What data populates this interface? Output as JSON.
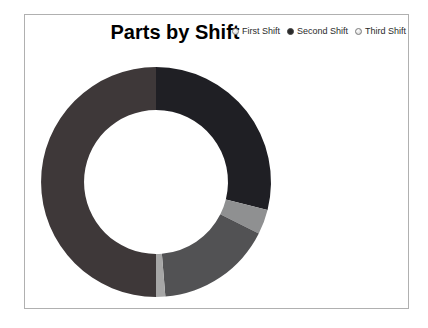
{
  "header": {
    "title": "Parts by Shift"
  },
  "legend": {
    "items": [
      {
        "label": "First Shift",
        "selected": false
      },
      {
        "label": "Second Shift",
        "selected": true
      },
      {
        "label": "Third Shift",
        "selected": false
      }
    ]
  },
  "chart_data": {
    "type": "pie",
    "title": "Parts by Shift",
    "donut": true,
    "start_angle_deg": 0,
    "clockwise": true,
    "inner_radius_ratio": 0.626,
    "legend_position": "top-right",
    "legend_entries": [
      "First Shift",
      "Second Shift",
      "Third Shift"
    ],
    "segments": [
      {
        "name": "segment-1-dark-navy",
        "value": 28.9,
        "color": "#1f1f24"
      },
      {
        "name": "segment-2-light-gray",
        "value": 3.5,
        "color": "#8f9091"
      },
      {
        "name": "segment-3-medium-gray",
        "value": 16.3,
        "color": "#525254"
      },
      {
        "name": "segment-4-pale-sliver",
        "value": 1.3,
        "color": "#a6a6a6"
      },
      {
        "name": "segment-5-dark-maroon",
        "value": 50.0,
        "color": "#3e3839"
      }
    ]
  }
}
